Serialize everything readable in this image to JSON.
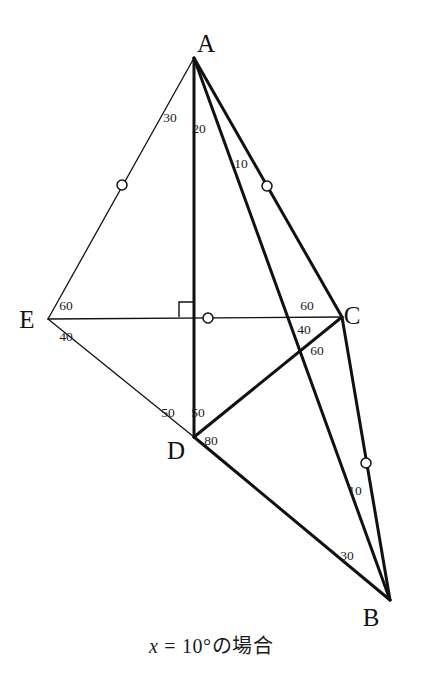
{
  "figure": {
    "type": "geometry-diagram",
    "title_caption": "x = 10°の場合",
    "caption_parts": {
      "variable": "x",
      "equals": "=",
      "value": "10°",
      "suffix": "の場合"
    },
    "vertices": [
      {
        "name": "A",
        "label": "A",
        "x": 194,
        "y": 58,
        "label_x": 206,
        "label_y": 52
      },
      {
        "name": "E",
        "label": "E",
        "x": 48,
        "y": 319,
        "label_x": 27,
        "label_y": 328
      },
      {
        "name": "C",
        "label": "C",
        "x": 342,
        "y": 317,
        "label_x": 352,
        "label_y": 324
      },
      {
        "name": "D",
        "label": "D",
        "x": 194,
        "y": 437,
        "label_x": 176,
        "label_y": 459
      },
      {
        "name": "B",
        "label": "B",
        "x": 390,
        "y": 600,
        "label_x": 371,
        "label_y": 626
      }
    ],
    "segments": [
      {
        "name": "segment-AE",
        "from": "A",
        "to": "E",
        "weight": "thin",
        "x1": 194,
        "y1": 58,
        "x2": 48,
        "y2": 319
      },
      {
        "name": "segment-EC",
        "from": "E",
        "to": "C",
        "weight": "thin",
        "x1": 48,
        "y1": 319,
        "x2": 342,
        "y2": 317
      },
      {
        "name": "segment-EB",
        "from": "E",
        "to": "B",
        "weight": "thin",
        "x1": 48,
        "y1": 319,
        "x2": 194,
        "y2": 437
      },
      {
        "name": "segment-AD",
        "from": "A",
        "to": "D",
        "weight": "thick",
        "x1": 194,
        "y1": 58,
        "x2": 194,
        "y2": 437
      },
      {
        "name": "segment-AC",
        "from": "A",
        "to": "C",
        "weight": "thick",
        "x1": 194,
        "y1": 58,
        "x2": 342,
        "y2": 317
      },
      {
        "name": "segment-AB",
        "from": "A",
        "to": "B",
        "weight": "thick",
        "x1": 194,
        "y1": 58,
        "x2": 390,
        "y2": 600
      },
      {
        "name": "segment-DC",
        "from": "D",
        "to": "C",
        "weight": "thick",
        "x1": 194,
        "y1": 437,
        "x2": 342,
        "y2": 317
      },
      {
        "name": "segment-DB",
        "from": "D",
        "to": "B",
        "weight": "thick",
        "x1": 194,
        "y1": 437,
        "x2": 390,
        "y2": 600
      },
      {
        "name": "segment-CB",
        "from": "C",
        "to": "B",
        "weight": "thick",
        "x1": 342,
        "y1": 317,
        "x2": 390,
        "y2": 600
      }
    ],
    "right_angle_marker": {
      "name": "right-angle-marker-at-foot",
      "at_x": 194,
      "at_y": 317,
      "size": 15,
      "orientation": "upper-left"
    },
    "tick_circles": [
      {
        "name": "tick-circle-on-AE",
        "on": "AE",
        "cx": 122,
        "cy": 185,
        "r": 5
      },
      {
        "name": "tick-circle-on-AC",
        "on": "AC",
        "cx": 267,
        "cy": 186,
        "r": 5
      },
      {
        "name": "tick-circle-on-EC",
        "on": "EC",
        "cx": 208,
        "cy": 318,
        "r": 5
      },
      {
        "name": "tick-circle-on-CB",
        "on": "CB",
        "cx": 366,
        "cy": 463,
        "r": 5
      }
    ],
    "angle_labels": [
      {
        "name": "angle-label-DAE",
        "value": "30",
        "x": 170,
        "y": 122,
        "at_vertex": "A"
      },
      {
        "name": "angle-label-DAC",
        "value": "20",
        "x": 199,
        "y": 133,
        "at_vertex": "A"
      },
      {
        "name": "angle-label-CAB",
        "value": "10",
        "x": 241,
        "y": 168,
        "at_vertex": "A"
      },
      {
        "name": "angle-label-AEC",
        "value": "60",
        "x": 66,
        "y": 310,
        "at_vertex": "E"
      },
      {
        "name": "angle-label-CEB",
        "value": "40",
        "x": 66,
        "y": 341,
        "at_vertex": "E"
      },
      {
        "name": "angle-label-ACE",
        "value": "60",
        "x": 307,
        "y": 310,
        "at_vertex": "C"
      },
      {
        "name": "angle-label-ECD",
        "value": "40",
        "x": 304,
        "y": 334,
        "at_vertex": "C"
      },
      {
        "name": "angle-label-DCB",
        "value": "60",
        "x": 317,
        "y": 355,
        "at_vertex": "C"
      },
      {
        "name": "angle-label-EDA",
        "value": "50",
        "x": 168,
        "y": 417,
        "at_vertex": "D"
      },
      {
        "name": "angle-label-ADC",
        "value": "50",
        "x": 198,
        "y": 417,
        "at_vertex": "D"
      },
      {
        "name": "angle-label-CDB",
        "value": "80",
        "x": 211,
        "y": 445,
        "at_vertex": "D"
      },
      {
        "name": "angle-label-CBA",
        "value": "10",
        "x": 355,
        "y": 495,
        "at_vertex": "B"
      },
      {
        "name": "angle-label-ABD",
        "value": "30",
        "x": 347,
        "y": 560,
        "at_vertex": "B"
      }
    ],
    "colors": {
      "stroke": "#111111",
      "background": "#ffffff",
      "text": "#1a1a1a"
    },
    "stroke_widths": {
      "thin": 1.3,
      "thick": 3.0
    }
  }
}
